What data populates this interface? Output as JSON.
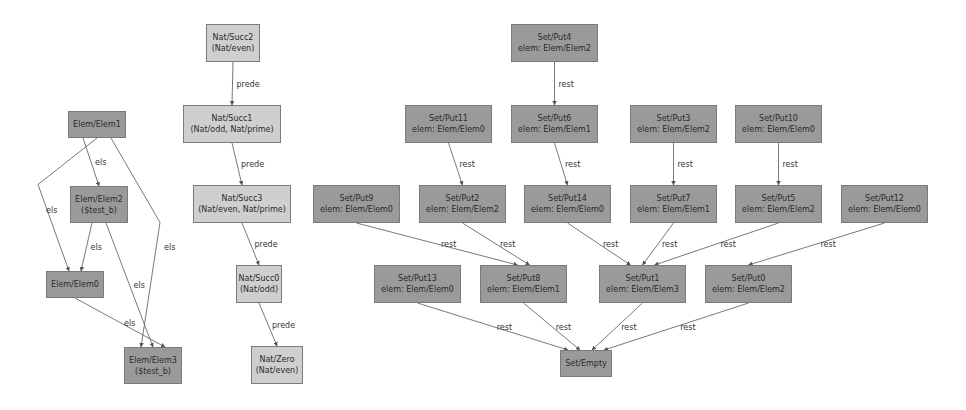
{
  "graph": {
    "nodes": [
      {
        "id": "elem1",
        "lines": [
          "Elem/Elem1"
        ],
        "style": "dark"
      },
      {
        "id": "elem2",
        "lines": [
          "Elem/Elem2",
          "($test_b)"
        ],
        "style": "dark"
      },
      {
        "id": "elem0",
        "lines": [
          "Elem/Elem0"
        ],
        "style": "dark"
      },
      {
        "id": "elem3",
        "lines": [
          "Elem/Elem3",
          "($test_b)"
        ],
        "style": "dark"
      },
      {
        "id": "succ2",
        "lines": [
          "Nat/Succ2",
          "(Nat/even)"
        ],
        "style": "light"
      },
      {
        "id": "succ1",
        "lines": [
          "Nat/Succ1",
          "(Nat/odd, Nat/prime)"
        ],
        "style": "light"
      },
      {
        "id": "succ3",
        "lines": [
          "Nat/Succ3",
          "(Nat/even, Nat/prime)"
        ],
        "style": "light"
      },
      {
        "id": "succ0",
        "lines": [
          "Nat/Succ0",
          "(Nat/odd)"
        ],
        "style": "light"
      },
      {
        "id": "zero",
        "lines": [
          "Nat/Zero",
          "(Nat/even)"
        ],
        "style": "light"
      },
      {
        "id": "put4",
        "lines": [
          "Set/Put4",
          "elem: Elem/Elem2"
        ],
        "style": "dark"
      },
      {
        "id": "put11",
        "lines": [
          "Set/Put11",
          "elem: Elem/Elem0"
        ],
        "style": "dark"
      },
      {
        "id": "put6",
        "lines": [
          "Set/Put6",
          "elem: Elem/Elem1"
        ],
        "style": "dark"
      },
      {
        "id": "put3",
        "lines": [
          "Set/Put3",
          "elem: Elem/Elem2"
        ],
        "style": "dark"
      },
      {
        "id": "put10",
        "lines": [
          "Set/Put10",
          "elem: Elem/Elem0"
        ],
        "style": "dark"
      },
      {
        "id": "put9",
        "lines": [
          "Set/Put9",
          "elem: Elem/Elem0"
        ],
        "style": "dark"
      },
      {
        "id": "put2",
        "lines": [
          "Set/Put2",
          "elem: Elem/Elem2"
        ],
        "style": "dark"
      },
      {
        "id": "put14",
        "lines": [
          "Set/Put14",
          "elem: Elem/Elem0"
        ],
        "style": "dark"
      },
      {
        "id": "put7",
        "lines": [
          "Set/Put7",
          "elem: Elem/Elem1"
        ],
        "style": "dark"
      },
      {
        "id": "put5",
        "lines": [
          "Set/Put5",
          "elem: Elem/Elem2"
        ],
        "style": "dark"
      },
      {
        "id": "put12",
        "lines": [
          "Set/Put12",
          "elem: Elem/Elem0"
        ],
        "style": "dark"
      },
      {
        "id": "put13",
        "lines": [
          "Set/Put13",
          "elem: Elem/Elem0"
        ],
        "style": "dark"
      },
      {
        "id": "put8",
        "lines": [
          "Set/Put8",
          "elem: Elem/Elem1"
        ],
        "style": "dark"
      },
      {
        "id": "put1",
        "lines": [
          "Set/Put1",
          "elem: Elem/Elem3"
        ],
        "style": "dark"
      },
      {
        "id": "put0",
        "lines": [
          "Set/Put0",
          "elem: Elem/Elem2"
        ],
        "style": "dark"
      },
      {
        "id": "empty",
        "lines": [
          "Set/Empty"
        ],
        "style": "dark"
      }
    ],
    "edges": [
      {
        "from": "elem1",
        "to": "elem2",
        "label": "els"
      },
      {
        "from": "elem1",
        "to": "elem0",
        "label": "els"
      },
      {
        "from": "elem1",
        "to": "elem3",
        "label": "els"
      },
      {
        "from": "elem2",
        "to": "elem0",
        "label": "els"
      },
      {
        "from": "elem2",
        "to": "elem3",
        "label": "els"
      },
      {
        "from": "elem0",
        "to": "elem3",
        "label": "els"
      },
      {
        "from": "succ2",
        "to": "succ1",
        "label": "prede"
      },
      {
        "from": "succ1",
        "to": "succ3",
        "label": "prede"
      },
      {
        "from": "succ3",
        "to": "succ0",
        "label": "prede"
      },
      {
        "from": "succ0",
        "to": "zero",
        "label": "prede"
      },
      {
        "from": "put4",
        "to": "put6",
        "label": "rest"
      },
      {
        "from": "put11",
        "to": "put2",
        "label": "rest"
      },
      {
        "from": "put6",
        "to": "put14",
        "label": "rest"
      },
      {
        "from": "put3",
        "to": "put7",
        "label": "rest"
      },
      {
        "from": "put10",
        "to": "put5",
        "label": "rest"
      },
      {
        "from": "put9",
        "to": "put8",
        "label": "rest"
      },
      {
        "from": "put2",
        "to": "put8",
        "label": "rest"
      },
      {
        "from": "put14",
        "to": "put1",
        "label": "rest"
      },
      {
        "from": "put7",
        "to": "put1",
        "label": "rest"
      },
      {
        "from": "put5",
        "to": "put1",
        "label": "rest"
      },
      {
        "from": "put12",
        "to": "put0",
        "label": "rest"
      },
      {
        "from": "put13",
        "to": "empty",
        "label": "rest"
      },
      {
        "from": "put8",
        "to": "empty",
        "label": "rest"
      },
      {
        "from": "put1",
        "to": "empty",
        "label": "rest"
      },
      {
        "from": "put0",
        "to": "empty",
        "label": "rest"
      }
    ]
  }
}
